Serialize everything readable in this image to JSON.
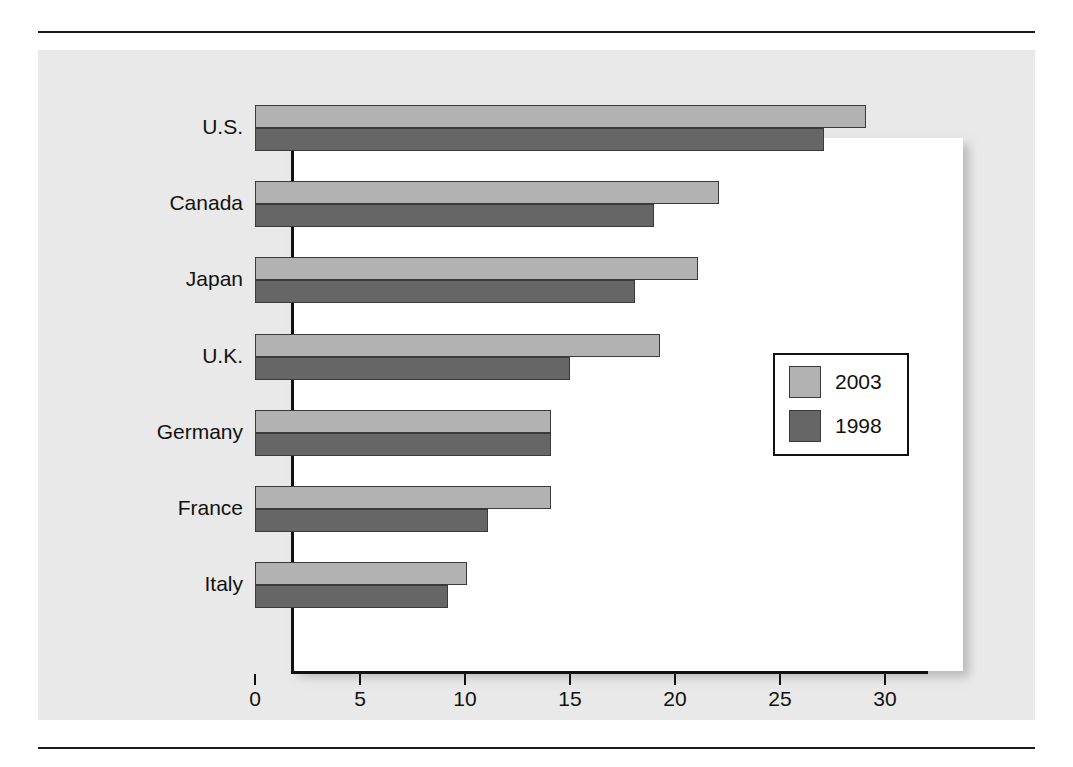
{
  "chart_data": {
    "type": "bar",
    "orientation": "horizontal",
    "title": "",
    "xlabel": "",
    "ylabel": "",
    "categories": [
      "U.S.",
      "Canada",
      "Japan",
      "U.K.",
      "Germany",
      "France",
      "Italy"
    ],
    "series": [
      {
        "name": "2003",
        "color": "#b2b2b2",
        "values": [
          29.1,
          22.1,
          21.1,
          19.3,
          14.1,
          14.1,
          10.1
        ]
      },
      {
        "name": "1998",
        "color": "#666666",
        "values": [
          27.1,
          19.0,
          18.1,
          15.0,
          14.1,
          11.1,
          9.2
        ]
      }
    ],
    "xlim": [
      0,
      30.5
    ],
    "xticks": [
      0,
      5,
      10,
      15,
      20,
      25,
      30
    ],
    "xtick_labels": [
      "0",
      "5",
      "10",
      "15",
      "20",
      "25",
      "30"
    ],
    "grid": false,
    "legend_position": "center-right",
    "legend_entries": [
      "2003",
      "1998"
    ]
  },
  "figure": {
    "panel_color": "#e9e9e9",
    "plot_background": "#ffffff",
    "axis_color": "#111111",
    "rule_color": "#1a1a1a"
  }
}
